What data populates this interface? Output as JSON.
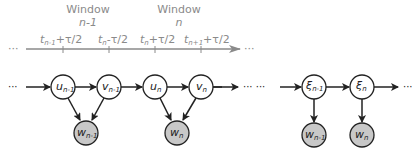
{
  "timeline": {
    "windows": [
      {
        "label": "Window",
        "index": "n-1"
      },
      {
        "label": "Window",
        "index": "n"
      }
    ],
    "ticks": [
      {
        "base": "t",
        "sub": "n-1",
        "suffix": "+τ/2"
      },
      {
        "base": "t",
        "sub": "n",
        "suffix": "-τ/2"
      },
      {
        "base": "t",
        "sub": "n",
        "suffix": "+τ/2"
      },
      {
        "base": "t",
        "sub": "n+1",
        "suffix": "+τ/2"
      }
    ],
    "ellipsis_left": "···",
    "ellipsis_right": "···",
    "color": "#8a8a8a"
  },
  "left_model": {
    "ellipsis": "···",
    "nodes": [
      {
        "id": "u_prev",
        "base": "u",
        "sub": "n-1",
        "type": "latent"
      },
      {
        "id": "v_prev",
        "base": "v",
        "sub": "n-1",
        "type": "latent"
      },
      {
        "id": "u_cur",
        "base": "u",
        "sub": "n",
        "type": "latent"
      },
      {
        "id": "v_cur",
        "base": "v",
        "sub": "n",
        "type": "latent"
      },
      {
        "id": "w_prev",
        "base": "w",
        "sub": "n-1",
        "type": "observed"
      },
      {
        "id": "w_cur",
        "base": "w",
        "sub": "n",
        "type": "observed"
      }
    ]
  },
  "right_model": {
    "ellipsis_left": "··· ···",
    "ellipsis_right": "···",
    "nodes": [
      {
        "id": "xi_prev",
        "base": "ξ",
        "sub": "n-1",
        "type": "latent"
      },
      {
        "id": "xi_cur",
        "base": "ξ",
        "sub": "n",
        "type": "latent"
      },
      {
        "id": "w_prev_r",
        "base": "w",
        "sub": "n-1",
        "type": "observed"
      },
      {
        "id": "w_cur_r",
        "base": "w",
        "sub": "n",
        "type": "observed"
      }
    ]
  },
  "colors": {
    "latent_fill": "#ffffff",
    "observed_fill": "#c8c8c8",
    "edge": "#222222"
  }
}
